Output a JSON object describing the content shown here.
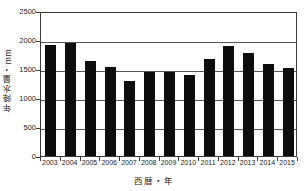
{
  "chart_data": {
    "type": "bar",
    "title": "",
    "xlabel": "西暦・年",
    "ylabel": "年降水量・mm",
    "categories": [
      "2003",
      "2004",
      "2005",
      "2006",
      "2007",
      "2008",
      "2009",
      "2010",
      "2011",
      "2012",
      "2013",
      "2014",
      "2015"
    ],
    "values": [
      1920,
      1950,
      1630,
      1540,
      1300,
      1450,
      1440,
      1390,
      1680,
      1900,
      1770,
      1580,
      1520
    ],
    "series": [
      {
        "name": "年降水量",
        "values": [
          1920,
          1950,
          1630,
          1540,
          1300,
          1450,
          1440,
          1390,
          1680,
          1900,
          1770,
          1580,
          1520
        ]
      }
    ],
    "ylim": [
      0,
      2500
    ],
    "ytick_values": [
      0,
      500,
      1000,
      1500,
      2000,
      2500
    ],
    "ytick_labels": [
      "0",
      "500",
      "1000",
      "1500",
      "2000",
      "2500"
    ],
    "grid": true,
    "grid_axis": "y",
    "legend": false,
    "legend_position": "none",
    "bar_color": "#0d0d0d",
    "axis_color": "#3a3a3a",
    "grid_color": "#555555",
    "background_color": "#ffffff"
  }
}
